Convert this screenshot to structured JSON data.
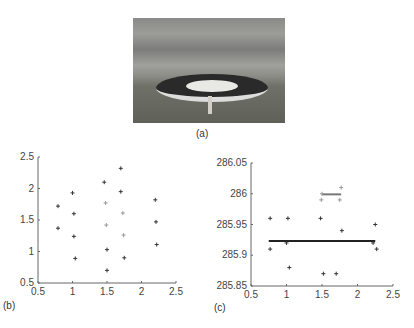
{
  "panels": {
    "a": "(a)",
    "b": "(b)",
    "c": "(c)"
  },
  "chart_data": [
    {
      "type": "scatter",
      "title": "(b)",
      "xlim": [
        0.5,
        2.5
      ],
      "ylim": [
        0.5,
        2.5
      ],
      "xticks": [
        "0.5",
        "1",
        "1.5",
        "2",
        "2.5"
      ],
      "yticks": [
        "0.5",
        "1",
        "1.5",
        "2",
        "2.5"
      ],
      "series": [
        {
          "name": "outer",
          "color": "#333333",
          "points": [
            [
              0.79,
              1.72
            ],
            [
              0.79,
              1.37
            ],
            [
              1.0,
              1.93
            ],
            [
              1.02,
              1.6
            ],
            [
              1.02,
              1.24
            ],
            [
              1.04,
              0.89
            ],
            [
              1.46,
              2.1
            ],
            [
              1.5,
              1.03
            ],
            [
              1.5,
              0.7
            ],
            [
              1.7,
              2.32
            ],
            [
              1.7,
              1.95
            ],
            [
              1.75,
              0.9
            ],
            [
              2.2,
              1.82
            ],
            [
              2.21,
              1.47
            ],
            [
              2.22,
              1.11
            ]
          ]
        },
        {
          "name": "inner",
          "color": "#999999",
          "points": [
            [
              1.48,
              1.77
            ],
            [
              1.49,
              1.42
            ],
            [
              1.73,
              1.61
            ],
            [
              1.74,
              1.26
            ]
          ]
        }
      ]
    },
    {
      "type": "scatter",
      "title": "(c)",
      "xlim": [
        0.5,
        2.5
      ],
      "ylim": [
        285.85,
        286.05
      ],
      "xticks": [
        "0.5",
        "1",
        "1.5",
        "2",
        "2.5"
      ],
      "yticks": [
        "285.85",
        "285.9",
        "285.95",
        "286",
        "286.05"
      ],
      "series": [
        {
          "name": "outer",
          "color": "#333333",
          "points": [
            [
              0.77,
              285.96
            ],
            [
              0.77,
              285.91
            ],
            [
              1.0,
              285.92
            ],
            [
              1.02,
              285.96
            ],
            [
              1.04,
              285.88
            ],
            [
              1.48,
              285.96
            ],
            [
              1.52,
              285.87
            ],
            [
              1.7,
              285.87
            ],
            [
              1.78,
              285.94
            ],
            [
              2.22,
              285.92
            ],
            [
              2.25,
              285.95
            ],
            [
              2.27,
              285.91
            ]
          ],
          "mean_line": {
            "x": [
              0.75,
              2.25
            ],
            "y": 285.923
          }
        },
        {
          "name": "inner",
          "color": "#999999",
          "points": [
            [
              1.49,
              285.99
            ],
            [
              1.5,
              286.0
            ],
            [
              1.75,
              285.99
            ],
            [
              1.77,
              286.01
            ]
          ],
          "mean_line": {
            "x": [
              1.5,
              1.77
            ],
            "y": 285.999
          }
        }
      ]
    }
  ]
}
